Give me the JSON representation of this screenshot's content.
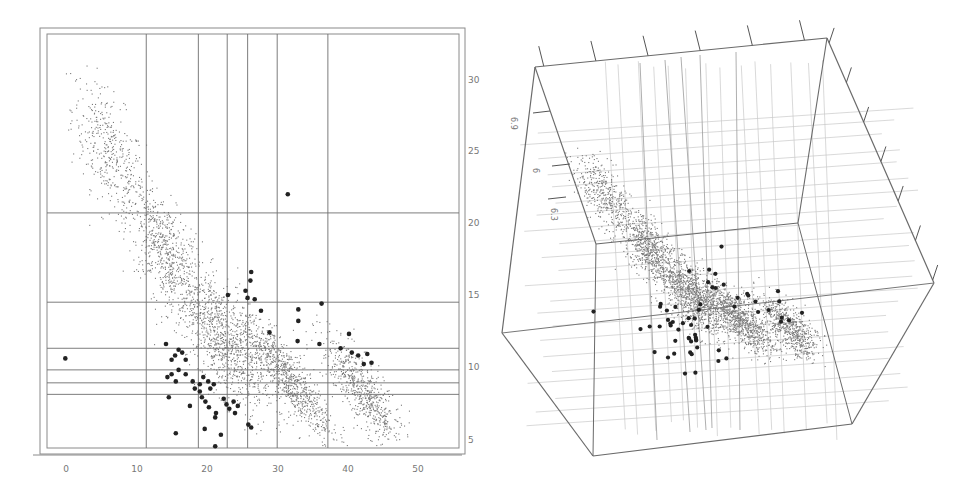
{
  "chart_data": [
    {
      "type": "scatter",
      "title": "",
      "xlabel": "",
      "ylabel": "",
      "xlim": [
        -3,
        55
      ],
      "ylim": [
        4,
        33
      ],
      "x_ticks": [
        0,
        10,
        20,
        30,
        40,
        50
      ],
      "y_ticks": [
        5,
        10,
        15,
        20,
        25,
        30
      ],
      "y_axis_side": "right",
      "grid": "partition lines",
      "vertical_partition_lines_x": [
        11.4,
        18.8,
        22.9,
        25.8,
        30.0,
        37.2
      ],
      "horizontal_partition_lines_y": [
        20.7,
        14.5,
        11.3,
        9.8,
        8.9,
        8.1
      ],
      "series": [
        {
          "name": "background points (small)",
          "marker": "small dot",
          "description": "dense cloud decreasing from (0-10, 22-30) to (40-50, 6-10)",
          "clusters": [
            {
              "cx": 6,
              "cy": 25,
              "sx": 3.5,
              "sy": 2.6,
              "n": 400
            },
            {
              "cx": 14,
              "cy": 18,
              "sx": 3.5,
              "sy": 2.4,
              "n": 650
            },
            {
              "cx": 22,
              "cy": 12,
              "sx": 4.0,
              "sy": 2.4,
              "n": 900
            },
            {
              "cx": 31,
              "cy": 9.5,
              "sx": 4.5,
              "sy": 1.4,
              "n": 900
            },
            {
              "cx": 42,
              "cy": 8.3,
              "sx": 3.8,
              "sy": 1.5,
              "n": 650
            }
          ]
        },
        {
          "name": "highlighted points (large)",
          "marker": "large dot",
          "points": [
            [
              31.5,
              22.0
            ],
            [
              26.3,
              16.6
            ],
            [
              26.2,
              16.0
            ],
            [
              25.5,
              15.3
            ],
            [
              23.0,
              15.0
            ],
            [
              25.8,
              14.8
            ],
            [
              26.8,
              14.7
            ],
            [
              33.0,
              14.0
            ],
            [
              33.0,
              13.2
            ],
            [
              27.7,
              13.9
            ],
            [
              36.3,
              14.4
            ],
            [
              28.9,
              12.4
            ],
            [
              32.9,
              11.8
            ],
            [
              36.0,
              11.6
            ],
            [
              40.2,
              12.3
            ],
            [
              14.2,
              11.6
            ],
            [
              15.0,
              10.5
            ],
            [
              15.5,
              10.8
            ],
            [
              16.0,
              11.2
            ],
            [
              16.5,
              11.0
            ],
            [
              17.0,
              10.5
            ],
            [
              16.0,
              9.8
            ],
            [
              14.4,
              9.3
            ],
            [
              15.0,
              9.5
            ],
            [
              15.6,
              9.0
            ],
            [
              17.0,
              9.5
            ],
            [
              18.0,
              9.0
            ],
            [
              18.3,
              8.5
            ],
            [
              19.0,
              8.8
            ],
            [
              19.5,
              9.3
            ],
            [
              20.2,
              9.0
            ],
            [
              20.5,
              8.5
            ],
            [
              21.0,
              8.8
            ],
            [
              19.0,
              8.3
            ],
            [
              19.3,
              7.9
            ],
            [
              19.8,
              7.6
            ],
            [
              17.6,
              7.3
            ],
            [
              14.6,
              7.9
            ],
            [
              21.3,
              6.8
            ],
            [
              21.2,
              6.5
            ],
            [
              20.3,
              7.2
            ],
            [
              22.4,
              7.8
            ],
            [
              22.8,
              7.4
            ],
            [
              23.2,
              7.1
            ],
            [
              23.8,
              7.6
            ],
            [
              24.4,
              7.3
            ],
            [
              24.0,
              6.8
            ],
            [
              25.9,
              6.0
            ],
            [
              26.3,
              5.8
            ],
            [
              19.7,
              5.7
            ],
            [
              22.0,
              5.3
            ],
            [
              15.6,
              5.4
            ],
            [
              21.2,
              4.5
            ],
            [
              -0.1,
              10.6
            ],
            [
              39.0,
              11.3
            ],
            [
              40.6,
              11.0
            ],
            [
              41.5,
              10.8
            ],
            [
              42.3,
              10.2
            ],
            [
              42.8,
              10.9
            ],
            [
              43.4,
              10.3
            ]
          ]
        }
      ],
      "annotations": []
    },
    {
      "type": "scatter",
      "subtype": "3d",
      "title": "",
      "axis_tick_labels": [
        "6.9",
        "6",
        "6.3"
      ],
      "grid": "3d partition planes drawn as light lines",
      "description": "3D rotated view of the same point cloud with highlighted large points, inside a wireframe box"
    }
  ],
  "left_plot": {
    "x_tick_labels": [
      "0",
      "10",
      "20",
      "30",
      "40",
      "50"
    ],
    "y_tick_labels": [
      "30",
      "25",
      "20",
      "15",
      "10",
      "5"
    ]
  },
  "right_plot": {
    "axis_labels": [
      "6.9",
      "6",
      "6.3"
    ]
  },
  "colors": {
    "frame": "#8a8a8a",
    "partition_line": "#6e6e6e",
    "small_point": "#7a7a7a",
    "large_point": "#222222",
    "tick_text": "#808080",
    "light_line": "#c8c8c8"
  }
}
